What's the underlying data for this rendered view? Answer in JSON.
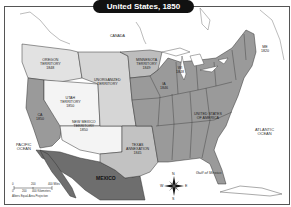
{
  "title": "United States, 1850",
  "colors": {
    "states": "#9a9a9a",
    "territories_light": "#d6d6d6",
    "utah_nm": "#f4f4f4",
    "mexico": "#6e6e6e",
    "water": "#ffffff",
    "border": "#333333"
  },
  "regions": {
    "canada": "CANADA",
    "oregon": [
      "OREGON",
      "TERRITORY",
      "1848"
    ],
    "minnesota": [
      "MINNESOTA",
      "TERRITORY",
      "1849"
    ],
    "unorganized": [
      "UNORGANIZED",
      "TERRITORY"
    ],
    "utah": [
      "UTAH",
      "TERRITORY",
      "1850"
    ],
    "new_mexico": [
      "NEW MEXICO",
      "TERRITORY",
      "1850"
    ],
    "texas": [
      "TEXAS",
      "ANNEXATION",
      "1845"
    ],
    "usa": [
      "UNITED STATES",
      "OF AMERICA"
    ],
    "california": [
      "CA",
      "1850"
    ],
    "iowa": [
      "IA",
      "1846"
    ],
    "wisconsin": [
      "WI",
      "1848"
    ],
    "maine": [
      "ME",
      "1820"
    ],
    "mexico": "MEXICO"
  },
  "water": {
    "pacific": [
      "PACIFIC",
      "OCEAN"
    ],
    "atlantic": [
      "ATLANTIC",
      "OCEAN"
    ],
    "gulf": "Gulf of Mexico"
  },
  "compass": {
    "n": "N",
    "s": "S",
    "e": "E",
    "w": "W"
  },
  "scale": {
    "miles": [
      "0",
      "200",
      "400 Miles"
    ],
    "km": [
      "0",
      "200",
      "400 Kilometers"
    ],
    "projection": "Albers Equal-Area Projection"
  }
}
